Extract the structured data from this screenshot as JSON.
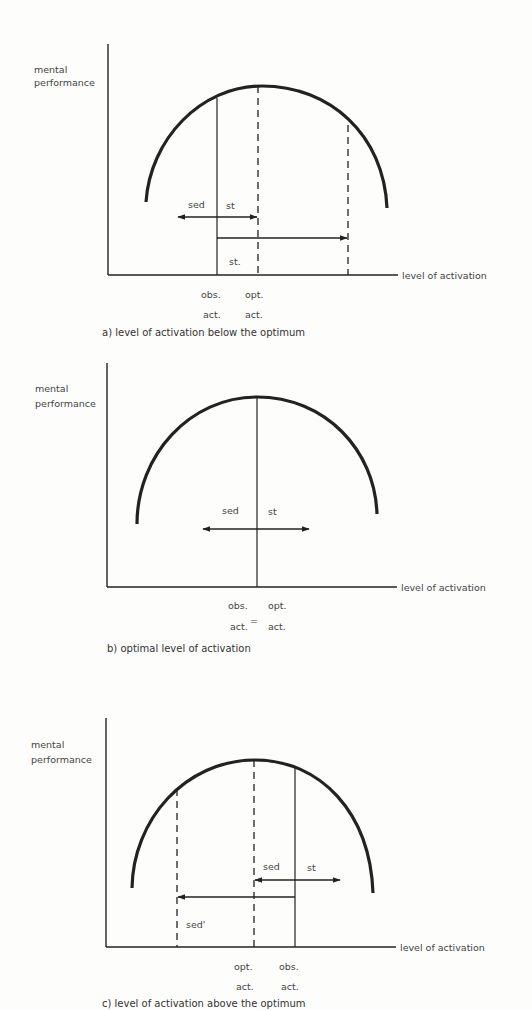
{
  "panels": [
    {
      "id": "a",
      "y_label_1": "mental",
      "y_label_2": "performance",
      "x_label": "level of activation",
      "arrow_label_sed": "sed",
      "arrow_label_st": "st",
      "arrow_label_st2": "st.",
      "tick_1_top": "obs.",
      "tick_1_bottom": "act.",
      "tick_2_top": "opt.",
      "tick_2_bottom": "act.",
      "caption": "a) level of activation below the optimum"
    },
    {
      "id": "b",
      "y_label_1": "mental",
      "y_label_2": "performance",
      "x_label": "level of activation",
      "arrow_label_sed": "sed",
      "arrow_label_st": "st",
      "tick_1_top": "obs.",
      "tick_1_bottom": "act.",
      "equals": "=",
      "tick_2_top": "opt.",
      "tick_2_bottom": "act.",
      "caption": "b) optimal level of activation"
    },
    {
      "id": "c",
      "y_label_1": "mental",
      "y_label_2": "performance",
      "x_label": "level of activation",
      "arrow_label_sed": "sed",
      "arrow_label_st": "st",
      "arrow_label_sed2": "sed'",
      "tick_1_top": "opt.",
      "tick_1_bottom": "act.",
      "tick_2_top": "obs.",
      "tick_2_bottom": "act.",
      "caption": "c) level of activation above the optimum"
    }
  ]
}
